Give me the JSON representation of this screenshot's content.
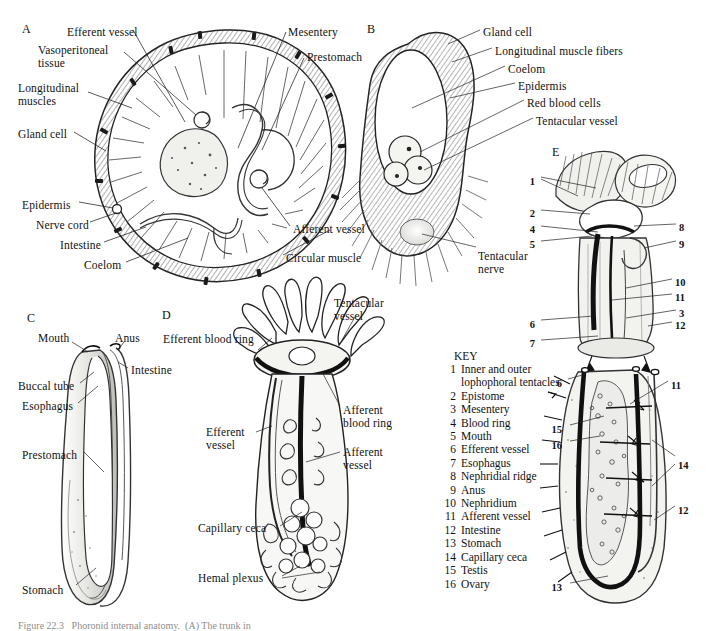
{
  "figure": {
    "panels": [
      {
        "id": "A",
        "x": 22,
        "y": 22
      },
      {
        "id": "B",
        "x": 367,
        "y": 22
      },
      {
        "id": "C",
        "x": 27,
        "y": 311
      },
      {
        "id": "D",
        "x": 162,
        "y": 308
      },
      {
        "id": "E",
        "x": 552,
        "y": 145
      }
    ],
    "caption": "Figure 22.3   Phoronid internal anatomy.  (A) The trunk in"
  },
  "panel_a": {
    "title": "(A)",
    "labels": [
      {
        "text": "Efferent vessel",
        "x": 67,
        "y": 26,
        "align": "left"
      },
      {
        "text": "Vasoperitoneal\ntissue",
        "x": 38,
        "y": 44,
        "align": "left"
      },
      {
        "text": "Longitudinal\nmuscles",
        "x": 18,
        "y": 82,
        "align": "left"
      },
      {
        "text": "Gland cell",
        "x": 18,
        "y": 128,
        "align": "left"
      },
      {
        "text": "Epidermis",
        "x": 22,
        "y": 199,
        "align": "left"
      },
      {
        "text": "Nerve cord",
        "x": 36,
        "y": 219,
        "align": "left"
      },
      {
        "text": "Intestine",
        "x": 60,
        "y": 239,
        "align": "left"
      },
      {
        "text": "Coelom",
        "x": 84,
        "y": 259,
        "align": "left"
      },
      {
        "text": "Mesentery",
        "x": 288,
        "y": 26,
        "align": "left"
      },
      {
        "text": "Prestomach",
        "x": 307,
        "y": 51,
        "align": "left"
      },
      {
        "text": "Afferent vessel",
        "x": 293,
        "y": 223,
        "align": "left"
      },
      {
        "text": "Circular muscle",
        "x": 286,
        "y": 252,
        "align": "left"
      }
    ]
  },
  "panel_b": {
    "title": "(B)",
    "labels": [
      {
        "text": "Gland cell",
        "x": 483,
        "y": 26,
        "align": "left"
      },
      {
        "text": "Longitudinal muscle fibers",
        "x": 495,
        "y": 45,
        "align": "left"
      },
      {
        "text": "Coelom",
        "x": 508,
        "y": 63,
        "align": "left"
      },
      {
        "text": "Epidermis",
        "x": 518,
        "y": 80,
        "align": "left"
      },
      {
        "text": "Red blood cells",
        "x": 527,
        "y": 97,
        "align": "left"
      },
      {
        "text": "Tentacular vessel",
        "x": 536,
        "y": 115,
        "align": "left"
      },
      {
        "text": "Tentacular\nnerve",
        "x": 478,
        "y": 250,
        "align": "left"
      }
    ]
  },
  "panel_c": {
    "title": "(C)",
    "labels": [
      {
        "text": "Mouth",
        "x": 38,
        "y": 332,
        "align": "left"
      },
      {
        "text": "Anus",
        "x": 115,
        "y": 332,
        "align": "left"
      },
      {
        "text": "Intestine",
        "x": 131,
        "y": 364,
        "align": "left"
      },
      {
        "text": "Buccal tube",
        "x": 18,
        "y": 380,
        "align": "left"
      },
      {
        "text": "Esophagus",
        "x": 22,
        "y": 400,
        "align": "left"
      },
      {
        "text": "Prestomach",
        "x": 22,
        "y": 449,
        "align": "left"
      },
      {
        "text": "Stomach",
        "x": 22,
        "y": 584,
        "align": "left"
      }
    ]
  },
  "panel_d": {
    "title": "(D)",
    "labels": [
      {
        "text": "Tentacular\nvessel",
        "x": 334,
        "y": 297,
        "align": "left"
      },
      {
        "text": "Efferent blood ring",
        "x": 163,
        "y": 333,
        "align": "left"
      },
      {
        "text": "Afferent\nblood ring",
        "x": 343,
        "y": 404,
        "align": "left"
      },
      {
        "text": "Efferent\nvessel",
        "x": 206,
        "y": 426,
        "align": "left"
      },
      {
        "text": "Afferent\nvessel",
        "x": 343,
        "y": 446,
        "align": "left"
      },
      {
        "text": "Capillary ceca",
        "x": 198,
        "y": 522,
        "align": "left"
      },
      {
        "text": "Hemal plexus",
        "x": 198,
        "y": 572,
        "align": "left"
      }
    ]
  },
  "panel_e": {
    "title": "(E)",
    "callouts_upper": [
      {
        "n": "1",
        "x": 535,
        "y": 176,
        "align": "right"
      },
      {
        "n": "2",
        "x": 535,
        "y": 208,
        "align": "right"
      },
      {
        "n": "4",
        "x": 535,
        "y": 224,
        "align": "right"
      },
      {
        "n": "5",
        "x": 535,
        "y": 239,
        "align": "right"
      },
      {
        "n": "6",
        "x": 535,
        "y": 319,
        "align": "right"
      },
      {
        "n": "7",
        "x": 535,
        "y": 338,
        "align": "right"
      },
      {
        "n": "8",
        "x": 679,
        "y": 222,
        "align": "left"
      },
      {
        "n": "9",
        "x": 679,
        "y": 239,
        "align": "left"
      },
      {
        "n": "10",
        "x": 675,
        "y": 277,
        "align": "left"
      },
      {
        "n": "11",
        "x": 675,
        "y": 292,
        "align": "left"
      },
      {
        "n": "3",
        "x": 679,
        "y": 308,
        "align": "left"
      },
      {
        "n": "12",
        "x": 675,
        "y": 320,
        "align": "left"
      }
    ],
    "callouts_lower": [
      {
        "n": "6",
        "x": 562,
        "y": 378,
        "align": "right"
      },
      {
        "n": "15",
        "x": 562,
        "y": 424,
        "align": "right"
      },
      {
        "n": "16",
        "x": 562,
        "y": 440,
        "align": "right"
      },
      {
        "n": "13",
        "x": 562,
        "y": 582,
        "align": "right"
      },
      {
        "n": "11",
        "x": 671,
        "y": 380,
        "align": "left"
      },
      {
        "n": "14",
        "x": 678,
        "y": 460,
        "align": "left"
      },
      {
        "n": "12",
        "x": 678,
        "y": 505,
        "align": "left"
      }
    ]
  },
  "key": {
    "title": "KEY",
    "items": [
      {
        "n": "1",
        "label": "Inner and outer\nlophophoral tentacles"
      },
      {
        "n": "2",
        "label": "Epistome"
      },
      {
        "n": "3",
        "label": "Mesentery"
      },
      {
        "n": "4",
        "label": "Blood ring"
      },
      {
        "n": "5",
        "label": "Mouth"
      },
      {
        "n": "6",
        "label": "Efferent vessel"
      },
      {
        "n": "7",
        "label": "Esophagus"
      },
      {
        "n": "8",
        "label": "Nephridial ridge"
      },
      {
        "n": "9",
        "label": "Anus"
      },
      {
        "n": "10",
        "label": "Nephridium"
      },
      {
        "n": "11",
        "label": "Afferent vessel"
      },
      {
        "n": "12",
        "label": "Intestine"
      },
      {
        "n": "13",
        "label": "Stomach"
      },
      {
        "n": "14",
        "label": "Capillary ceca"
      },
      {
        "n": "15",
        "label": "Testis"
      },
      {
        "n": "16",
        "label": "Ovary"
      }
    ]
  },
  "colors": {
    "ink": "#111111",
    "paper": "#ffffff",
    "shade": "#6e6e6e",
    "light_fill": "#ededea"
  }
}
